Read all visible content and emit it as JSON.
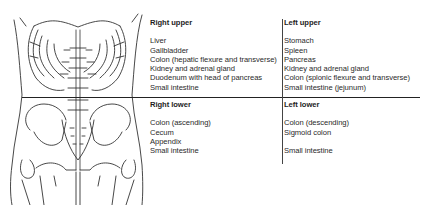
{
  "figure": {
    "type": "abdominal-quadrants-diagram",
    "quadrants": {
      "right_upper": {
        "title": "Right upper",
        "items": [
          "Liver",
          "Gallbladder",
          "Colon (hepatic flexure and transverse)",
          "Kidney and adrenal gland",
          "Duodenum with head of pancreas",
          "Small intestine"
        ]
      },
      "left_upper": {
        "title": "Left upper",
        "items": [
          "Stomach",
          "Spleen",
          "Pancreas",
          "Kidney and adrenal gland",
          "Colon (splonic  flexure and transverse)",
          "Small intestine (jejunum)"
        ]
      },
      "right_lower": {
        "title": "Right lower",
        "items": [
          "Colon (ascending)",
          "Cecum",
          "Appendix",
          "Small intestine"
        ]
      },
      "left_lower": {
        "title": "Left lower",
        "items": [
          "Colon (descending)",
          "Sigmoid colon",
          "",
          "Small intestine"
        ]
      }
    },
    "colors": {
      "line": "#222222",
      "text": "#2a2a2a",
      "background": "#ffffff"
    }
  }
}
